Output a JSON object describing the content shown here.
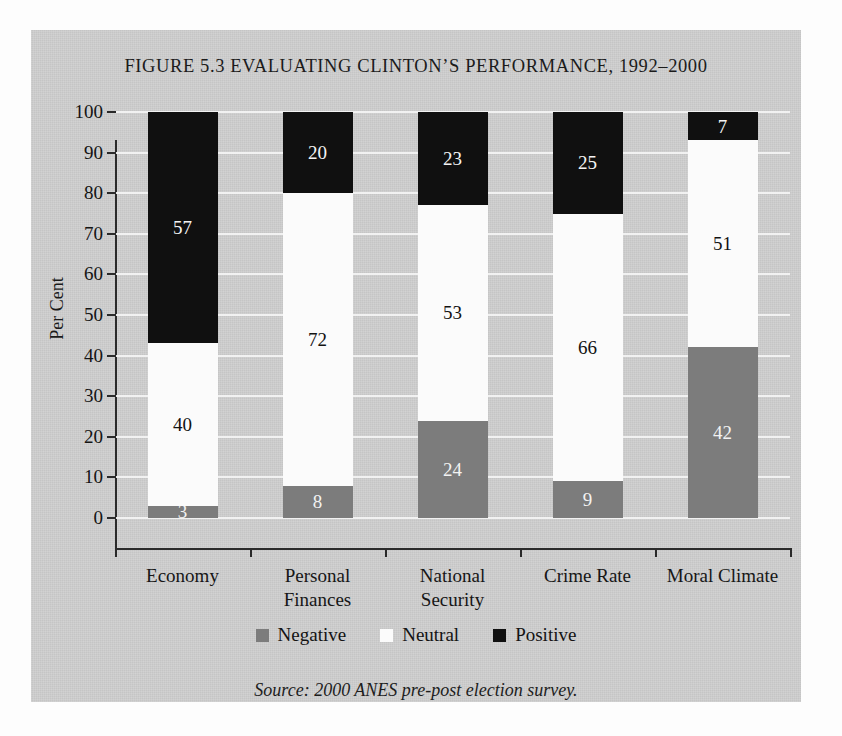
{
  "figure": {
    "title": "FIGURE 5.3 EVALUATING CLINTON’S PERFORMANCE, 1992–2000",
    "source_note": "Source: 2000 ANES pre-post election survey.",
    "panel_background": "#cdcdcd"
  },
  "axes": {
    "y_title": "Per Cent",
    "y_ticks": [
      "100",
      "90",
      "80",
      "70",
      "60",
      "50",
      "40",
      "30",
      "20",
      "10",
      "0"
    ]
  },
  "legend": {
    "items": [
      {
        "label": "Negative",
        "color": "#7c7c7c"
      },
      {
        "label": "Neutral",
        "color": "#fbfbfb"
      },
      {
        "label": "Positive",
        "color": "#101010"
      }
    ]
  },
  "chart_data": {
    "type": "bar",
    "subtype": "stacked-vertical-100",
    "title": "FIGURE 5.3 EVALUATING CLINTON’S PERFORMANCE, 1992–2000",
    "xlabel": "",
    "ylabel": "Per Cent",
    "ylim": [
      0,
      100
    ],
    "ytick_step": 10,
    "grid": true,
    "grid_color": "#f4f4f4",
    "legend_position": "bottom",
    "categories": [
      "Economy",
      "Personal Finances",
      "National Security",
      "Crime Rate",
      "Moral Climate"
    ],
    "category_label_lines": [
      [
        "Economy"
      ],
      [
        "Personal",
        "Finances"
      ],
      [
        "National",
        "Security"
      ],
      [
        "Crime Rate"
      ],
      [
        "Moral Climate"
      ]
    ],
    "series": [
      {
        "name": "Negative",
        "color": "#7c7c7c",
        "values": [
          3,
          8,
          24,
          9,
          42
        ]
      },
      {
        "name": "Neutral",
        "color": "#fbfbfb",
        "values": [
          40,
          72,
          53,
          66,
          51
        ]
      },
      {
        "name": "Positive",
        "color": "#101010",
        "values": [
          57,
          20,
          23,
          25,
          7
        ]
      }
    ],
    "data_labels": {
      "Economy": {
        "Negative": "3",
        "Neutral": "40",
        "Positive": "57"
      },
      "Personal Finances": {
        "Negative": "8",
        "Neutral": "72",
        "Positive": "20"
      },
      "National Security": {
        "Negative": "24",
        "Neutral": "53",
        "Positive": "23"
      },
      "Crime Rate": {
        "Negative": "9",
        "Neutral": "66",
        "Positive": "25"
      },
      "Moral Climate": {
        "Negative": "42",
        "Neutral": "51",
        "Positive": "7"
      }
    },
    "source": "Source: 2000 ANES pre-post election survey."
  }
}
